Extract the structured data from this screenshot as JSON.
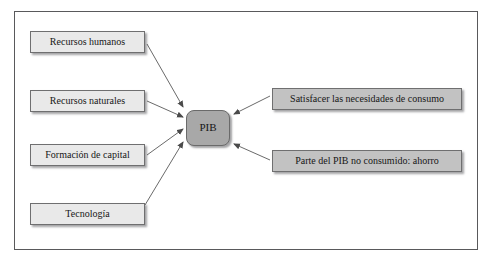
{
  "diagram": {
    "frame": {
      "border_color": "#59595b"
    },
    "center_node": {
      "id": "pib",
      "label": "PIB",
      "fill": "#a8a8a8",
      "shape": "rounded-rectangle"
    },
    "left_nodes": [
      {
        "id": "recursos-humanos",
        "label": "Recursos humanos",
        "fill": "#e9e9e9"
      },
      {
        "id": "recursos-naturales",
        "label": "Recursos naturales",
        "fill": "#e9e9e9"
      },
      {
        "id": "formacion-capital",
        "label": "Formación de capital",
        "fill": "#e9e9e9"
      },
      {
        "id": "tecnologia",
        "label": "Tecnología",
        "fill": "#e9e9e9"
      }
    ],
    "right_nodes": [
      {
        "id": "satisfacer",
        "label": "Satisfacer las necesidades de consumo",
        "fill": "#c2c2c2"
      },
      {
        "id": "ahorro",
        "label": "Parte del PIB no consumido: ahorro",
        "fill": "#c2c2c2"
      }
    ],
    "edges": [
      {
        "from": "recursos-humanos",
        "to": "pib",
        "direction": "to-center"
      },
      {
        "from": "recursos-naturales",
        "to": "pib",
        "direction": "to-center"
      },
      {
        "from": "formacion-capital",
        "to": "pib",
        "direction": "to-center"
      },
      {
        "from": "tecnologia",
        "to": "pib",
        "direction": "to-center"
      },
      {
        "from": "satisfacer",
        "to": "pib",
        "direction": "to-center"
      },
      {
        "from": "ahorro",
        "to": "pib",
        "direction": "to-center"
      }
    ],
    "edge_color": "#6a6a6a"
  }
}
